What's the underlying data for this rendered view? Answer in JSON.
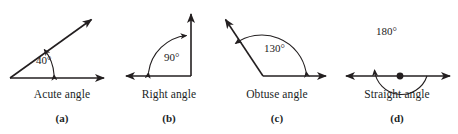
{
  "figure": {
    "stroke_color": "#231f20",
    "background_color": "#ffffff",
    "panels": [
      {
        "id": "acute",
        "letter": "(a)",
        "name": "Acute angle",
        "measure": "40°",
        "vertex": [
          10,
          78
        ],
        "rays": [
          {
            "name": "horizontal-ray",
            "to": [
              112,
              78
            ],
            "arrow": "end"
          },
          {
            "name": "slanted-ray",
            "to": [
              97,
              16
            ],
            "arrow": "end"
          }
        ],
        "arc": {
          "radius": 44,
          "start_deg": 0,
          "end_deg": 40,
          "arrowheads": "both"
        }
      },
      {
        "id": "right",
        "letter": "(b)",
        "name": "Right angle",
        "measure": "90°",
        "vertex": [
          77,
          76
        ],
        "rays": [
          {
            "name": "horizontal-ray",
            "to": [
              5,
              76
            ],
            "arrow": "end"
          },
          {
            "name": "vertical-ray",
            "to": [
              77,
              7
            ],
            "arrow": "end"
          }
        ],
        "arc": {
          "radius": 44,
          "start_deg": 90,
          "end_deg": 180,
          "arrowheads": "both"
        }
      },
      {
        "id": "obtuse",
        "letter": "(c)",
        "name": "Obtuse angle",
        "measure": "130°",
        "vertex": [
          49,
          76
        ],
        "rays": [
          {
            "name": "horizontal-ray",
            "to": [
              120,
              76
            ],
            "arrow": "end"
          },
          {
            "name": "slanted-ray",
            "to": [
              5,
              14
            ],
            "arrow": "end"
          }
        ],
        "arc": {
          "radius": 45,
          "start_deg": 0,
          "end_deg": 130,
          "arrowheads": "both"
        }
      },
      {
        "id": "straight",
        "letter": "(d)",
        "name": "Straight angle",
        "measure": "180°",
        "vertex": [
          64,
          76
        ],
        "rays": [
          {
            "name": "left-ray",
            "to": [
              4,
              76
            ],
            "arrow": "end"
          },
          {
            "name": "right-ray",
            "to": [
              120,
              76
            ],
            "arrow": "end"
          }
        ],
        "arc": {
          "radius": 27,
          "start_deg": 0,
          "end_deg": 180,
          "arrowheads": "start"
        },
        "vertex_dot": true
      }
    ]
  }
}
